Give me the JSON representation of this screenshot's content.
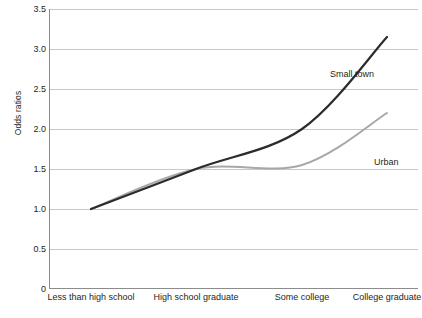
{
  "chart_data": {
    "type": "line",
    "title": "",
    "xlabel": "",
    "ylabel": "Odds ratios",
    "categories": [
      "Less than high school",
      "High school graduate",
      "Some college",
      "College graduate"
    ],
    "series": [
      {
        "name": "Small town",
        "color": "#2b2b2b",
        "values": [
          1.0,
          1.5,
          2.0,
          3.15
        ]
      },
      {
        "name": "Urban",
        "color": "#a8a8a8",
        "values": [
          1.0,
          1.5,
          1.55,
          2.2
        ]
      }
    ],
    "ylim": [
      0,
      3.5
    ],
    "y_ticks": [
      "0",
      "0.5",
      "1.0",
      "1.5",
      "2.0",
      "2.5",
      "3.0",
      "3.5"
    ],
    "y_tick_values": [
      0,
      0.5,
      1.0,
      1.5,
      2.0,
      2.5,
      3.0,
      3.5
    ],
    "grid": true,
    "legend_position": "inline-annotations",
    "annotations": [
      {
        "text": "Small town",
        "series": "Small town"
      },
      {
        "text": "Urban",
        "series": "Urban"
      }
    ],
    "colors": {
      "background": "#ffffff",
      "gridline": "#c8c8c8",
      "axis": "#808080",
      "text": "#231f20"
    }
  }
}
